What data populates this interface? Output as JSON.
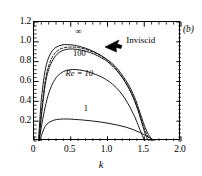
{
  "panel": {
    "label": "(b)"
  },
  "axes": {
    "x": {
      "title": "k",
      "min": 0,
      "max": 2.0,
      "ticks": [
        0,
        0.5,
        1.0,
        1.5,
        2.0
      ],
      "tick_labels": [
        "0",
        "0.5",
        "1.0",
        "1.5",
        "2.0"
      ],
      "minor_per_interval": 5
    },
    "y": {
      "title": "",
      "min": 0,
      "max": 1.2,
      "ticks": [
        0.2,
        0.4,
        0.6,
        0.8,
        1.0,
        1.2
      ],
      "tick_labels": [
        "0.2",
        "0.4",
        "0.6",
        "0.8",
        "1.0",
        "1.2"
      ],
      "minor_per_interval": 5
    }
  },
  "annotations": [
    {
      "name": "infinity-label",
      "text": "∞",
      "x": 0.62,
      "y": 1.08
    },
    {
      "name": "inviscid-label",
      "text": "Inviscid",
      "x": 1.27,
      "y": 0.99
    },
    {
      "name": "re-100-label",
      "text": "100",
      "x": 0.63,
      "y": 0.855
    },
    {
      "name": "re-10-label",
      "text": "Re = 10",
      "x": 0.63,
      "y": 0.655
    },
    {
      "name": "re-1-label",
      "text": "1",
      "x": 0.72,
      "y": 0.3
    }
  ],
  "chart_data": {
    "type": "line",
    "title": "",
    "xlabel": "k",
    "ylabel": "",
    "xlim": [
      0,
      2.0
    ],
    "ylim": [
      0,
      1.2
    ],
    "grid": false,
    "legend": "inline-curve-labels",
    "series": [
      {
        "name": "∞",
        "style": "solid",
        "x": [
          0.06,
          0.08,
          0.1,
          0.14,
          0.18,
          0.24,
          0.3,
          0.38,
          0.46,
          0.55,
          0.65,
          0.75,
          0.85,
          0.95,
          1.05,
          1.15,
          1.25,
          1.32,
          1.38,
          1.44,
          1.5,
          1.55,
          1.58,
          1.6,
          1.61
        ],
        "y": [
          0.0,
          0.22,
          0.42,
          0.66,
          0.8,
          0.9,
          0.945,
          0.968,
          0.972,
          0.965,
          0.948,
          0.922,
          0.888,
          0.845,
          0.79,
          0.715,
          0.61,
          0.52,
          0.42,
          0.29,
          0.16,
          0.075,
          0.04,
          0.015,
          0.0
        ]
      },
      {
        "name": "Inviscid",
        "style": "dashed",
        "x": [
          0.07,
          0.09,
          0.12,
          0.16,
          0.21,
          0.27,
          0.34,
          0.42,
          0.5,
          0.6,
          0.7,
          0.8,
          0.9,
          1.0,
          1.1,
          1.2,
          1.28,
          1.35,
          1.41,
          1.47,
          1.52,
          1.56,
          1.58
        ],
        "y": [
          0.0,
          0.2,
          0.42,
          0.64,
          0.78,
          0.87,
          0.92,
          0.942,
          0.948,
          0.942,
          0.925,
          0.898,
          0.862,
          0.812,
          0.742,
          0.645,
          0.55,
          0.445,
          0.325,
          0.19,
          0.09,
          0.03,
          0.0
        ]
      },
      {
        "name": "100",
        "style": "solid",
        "x": [
          0.07,
          0.09,
          0.12,
          0.16,
          0.21,
          0.28,
          0.35,
          0.43,
          0.52,
          0.62,
          0.72,
          0.82,
          0.92,
          1.02,
          1.12,
          1.21,
          1.29,
          1.36,
          1.42,
          1.47,
          1.51,
          1.54,
          1.56
        ],
        "y": [
          0.0,
          0.18,
          0.38,
          0.6,
          0.745,
          0.845,
          0.897,
          0.922,
          0.928,
          0.92,
          0.902,
          0.875,
          0.838,
          0.788,
          0.715,
          0.63,
          0.53,
          0.42,
          0.3,
          0.175,
          0.08,
          0.025,
          0.0
        ]
      },
      {
        "name": "Re = 10",
        "style": "solid",
        "x": [
          0.07,
          0.1,
          0.14,
          0.19,
          0.25,
          0.32,
          0.4,
          0.48,
          0.57,
          0.67,
          0.77,
          0.87,
          0.97,
          1.07,
          1.16,
          1.24,
          1.31,
          1.37,
          1.42,
          1.46,
          1.49,
          1.51
        ],
        "y": [
          0.0,
          0.14,
          0.3,
          0.455,
          0.575,
          0.655,
          0.7,
          0.718,
          0.72,
          0.71,
          0.69,
          0.662,
          0.625,
          0.572,
          0.505,
          0.425,
          0.335,
          0.245,
          0.155,
          0.08,
          0.028,
          0.0
        ]
      },
      {
        "name": "1",
        "style": "solid",
        "x": [
          0.08,
          0.11,
          0.15,
          0.2,
          0.27,
          0.35,
          0.45,
          0.55,
          0.66,
          0.78,
          0.9,
          1.02,
          1.14,
          1.25,
          1.35,
          1.44,
          1.52,
          1.58,
          1.62,
          1.65
        ],
        "y": [
          0.0,
          0.075,
          0.145,
          0.185,
          0.21,
          0.22,
          0.222,
          0.218,
          0.212,
          0.203,
          0.192,
          0.178,
          0.16,
          0.14,
          0.115,
          0.086,
          0.055,
          0.03,
          0.012,
          0.0
        ]
      }
    ]
  }
}
